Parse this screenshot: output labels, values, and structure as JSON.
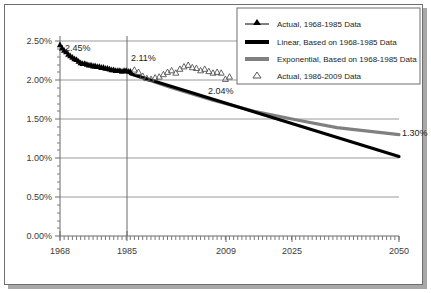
{
  "chart_data": {
    "type": "line",
    "title": "",
    "subtitle": "",
    "xlabel": "",
    "ylabel": "",
    "xlim": [
      1968,
      2050
    ],
    "ylim": [
      0.0,
      2.5
    ],
    "y_tick_labels": [
      "0.00%",
      "0.50%",
      "1.00%",
      "1.50%",
      "2.00%",
      "2.50%"
    ],
    "y_tick_values": [
      0.0,
      0.5,
      1.0,
      1.5,
      2.0,
      2.5
    ],
    "x_tick_labels": [
      "1968",
      "1985",
      "2009",
      "2025",
      "2050"
    ],
    "x_tick_values": [
      1968,
      1985,
      2009,
      2025,
      2050
    ],
    "grid": "horizontal",
    "legend_position": "top-right",
    "annotations": [
      {
        "name": "start-value",
        "text": "2.45%",
        "x": 1970,
        "y": 2.45
      },
      {
        "name": "breakpoint-value",
        "text": "2.11%",
        "x": 1986,
        "y": 2.22
      },
      {
        "name": "actual-end-value",
        "text": "2.04%",
        "x": 2008,
        "y": 1.9
      },
      {
        "name": "exponential-end-value",
        "text": "1.30%",
        "x": 2049,
        "y": 1.33
      }
    ],
    "series": [
      {
        "name": "Actual, 1968-1985 Data",
        "style": "marker-line",
        "marker": "filled-triangle",
        "color": "#000000",
        "x": [
          1968,
          1968.5,
          1969,
          1969.5,
          1970,
          1970.5,
          1971,
          1971.5,
          1972,
          1972.5,
          1973,
          1973.5,
          1974,
          1974.5,
          1975,
          1975.5,
          1976,
          1976.5,
          1977,
          1977.5,
          1978,
          1978.5,
          1979,
          1979.5,
          1980,
          1980.5,
          1981,
          1981.5,
          1982,
          1982.5,
          1983,
          1983.5,
          1984,
          1984.5,
          1985
        ],
        "values": [
          2.45,
          2.41,
          2.38,
          2.36,
          2.33,
          2.31,
          2.29,
          2.27,
          2.26,
          2.24,
          2.22,
          2.21,
          2.21,
          2.2,
          2.19,
          2.19,
          2.18,
          2.18,
          2.17,
          2.17,
          2.16,
          2.16,
          2.15,
          2.15,
          2.14,
          2.13,
          2.13,
          2.12,
          2.12,
          2.12,
          2.11,
          2.12,
          2.12,
          2.11,
          2.11
        ]
      },
      {
        "name": "Linear, Based on 1968-1985 Data",
        "style": "thick-line",
        "color": "#000000",
        "x": [
          1985,
          2050
        ],
        "values": [
          2.08,
          1.02
        ]
      },
      {
        "name": "Exponential, Based on 1968-1985 Data",
        "style": "thick-line",
        "color": "#808080",
        "x": [
          1985,
          1995,
          2005,
          2015,
          2025,
          2035,
          2050
        ],
        "values": [
          2.08,
          1.9,
          1.74,
          1.6,
          1.49,
          1.39,
          1.3
        ]
      },
      {
        "name": "Actual, 1986-2009 Data",
        "style": "marker-only",
        "marker": "hollow-triangle",
        "color": "#555555",
        "x": [
          1986,
          1987,
          1988,
          1989,
          1990,
          1991,
          1992,
          1993,
          1994,
          1995,
          1996,
          1997,
          1998,
          1999,
          2000,
          2001,
          2002,
          2003,
          2004,
          2005,
          2006,
          2007,
          2008,
          2009
        ],
        "values": [
          2.13,
          2.1,
          2.05,
          2.02,
          2.01,
          2.03,
          2.04,
          2.07,
          2.1,
          2.12,
          2.09,
          2.14,
          2.17,
          2.19,
          2.16,
          2.15,
          2.12,
          2.14,
          2.11,
          2.09,
          2.1,
          2.09,
          2.01,
          2.04
        ]
      }
    ]
  },
  "legend": {
    "items": [
      {
        "label": "Actual, 1968-1985 Data",
        "marker": "filled-triangle-line",
        "color": "#000000"
      },
      {
        "label": "Linear, Based on 1968-1985 Data",
        "marker": "thick-line",
        "color": "#000000"
      },
      {
        "label": "Exponential, Based on 1968-1985 Data",
        "marker": "thick-line",
        "color": "#808080"
      },
      {
        "label": "Actual, 1986-2009 Data",
        "marker": "hollow-triangle",
        "color": "#555555"
      }
    ]
  },
  "axes": {
    "y_labels": [
      "2.50%",
      "2.00%",
      "1.50%",
      "1.00%",
      "0.50%",
      "0.00%"
    ],
    "x_labels": [
      "1968",
      "1985",
      "2009",
      "2025",
      "2050"
    ]
  },
  "colors": {
    "linear": "#000000",
    "exponential": "#808080",
    "actual_old": "#000000",
    "actual_new": "#555555",
    "grid": "#9a9a9a",
    "frame": "#6e6e6e",
    "shadow": "#a8a8a8"
  }
}
